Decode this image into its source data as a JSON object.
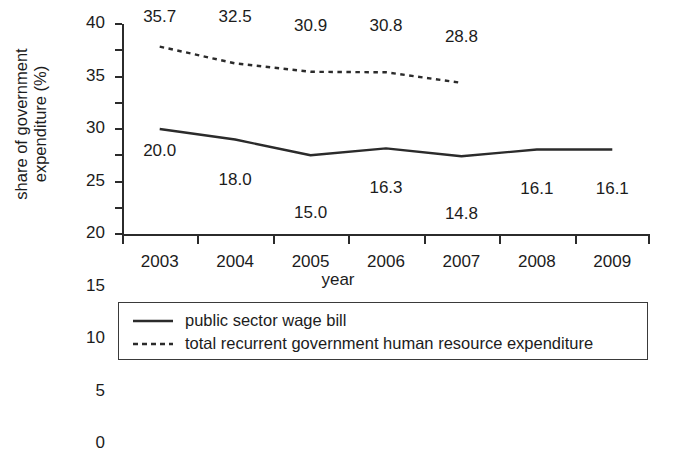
{
  "chart_data": {
    "type": "line",
    "title": "",
    "xlabel": "year",
    "ylabel": "share of government expenditure (%)",
    "ylabel_lines": [
      "share of government",
      "expenditure (%)"
    ],
    "categories": [
      "2003",
      "2004",
      "2005",
      "2006",
      "2007",
      "2008",
      "2009"
    ],
    "x": [
      2003,
      2004,
      2005,
      2006,
      2007,
      2008,
      2009
    ],
    "ylim": [
      0,
      40
    ],
    "yticks": [
      0,
      5,
      10,
      15,
      20,
      25,
      30,
      35,
      40
    ],
    "ytick_labels": [
      "0",
      "5",
      "10",
      "15",
      "20",
      "25",
      "30",
      "35",
      "40"
    ],
    "grid": false,
    "legend_position": "below-plot",
    "series": [
      {
        "name": "public sector wage bill",
        "style": "solid",
        "color": "#2b2b2b",
        "x": [
          2003,
          2004,
          2005,
          2006,
          2007,
          2008,
          2009
        ],
        "values": [
          20.0,
          18.0,
          15.0,
          16.3,
          14.8,
          16.1,
          16.1
        ],
        "labels": [
          "20.0",
          "18.0",
          "15.0",
          "16.3",
          "14.8",
          "16.1",
          "16.1"
        ],
        "label_position": "below"
      },
      {
        "name": "total recurrent government human resource expenditure",
        "style": "dotted",
        "color": "#2b2b2b",
        "x": [
          2003,
          2004,
          2005,
          2006,
          2007
        ],
        "values": [
          35.7,
          32.5,
          30.9,
          30.8,
          28.8
        ],
        "labels": [
          "35.7",
          "32.5",
          "30.9",
          "30.8",
          "28.8"
        ],
        "label_position": "above"
      }
    ]
  },
  "legend": {
    "entries": [
      {
        "label": "public sector wage bill",
        "style": "solid"
      },
      {
        "label": "total recurrent government human resource expenditure",
        "style": "dotted"
      }
    ]
  }
}
